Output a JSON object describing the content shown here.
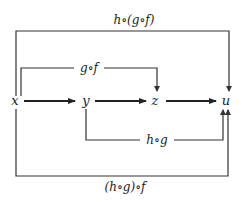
{
  "diagram": {
    "nodes": [
      {
        "id": "x",
        "label": "x"
      },
      {
        "id": "y",
        "label": "y"
      },
      {
        "id": "z",
        "label": "z"
      },
      {
        "id": "u",
        "label": "u"
      }
    ],
    "edges": [
      {
        "from": "x",
        "to": "y",
        "label": ""
      },
      {
        "from": "y",
        "to": "z",
        "label": ""
      },
      {
        "from": "z",
        "to": "u",
        "label": ""
      },
      {
        "from": "x",
        "to": "z",
        "label": "g∘f"
      },
      {
        "from": "y",
        "to": "u",
        "label": "h∘g"
      },
      {
        "from": "x",
        "to": "u",
        "label": "h∘(g∘f)",
        "route": "top"
      },
      {
        "from": "x",
        "to": "u",
        "label": "(h∘g)∘f",
        "route": "bottom"
      }
    ],
    "labels": {
      "top": "h∘(g∘f)",
      "inner_top": "g∘f",
      "inner_bottom": "h∘g",
      "bottom": "(h∘g)∘f"
    },
    "colors": {
      "line": "#333333",
      "background": "#ffffff"
    }
  }
}
